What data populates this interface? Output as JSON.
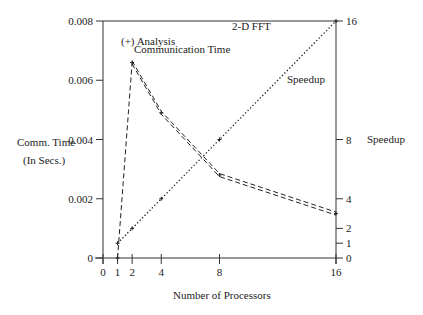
{
  "chart_data": {
    "type": "line",
    "title": "2-D FFT",
    "xlabel": "Number of Processors",
    "ylabel_left": [
      "Comm. Time",
      "(In Secs.)"
    ],
    "ylabel_right": "Speedup",
    "x_ticks": [
      0,
      1,
      2,
      4,
      8,
      16
    ],
    "xlim": [
      0,
      16
    ],
    "y_left_ticks": [
      "0",
      "0.002",
      "0.004",
      "0.006",
      "0.008"
    ],
    "y_left_tick_values": [
      0,
      0.002,
      0.004,
      0.006,
      0.008
    ],
    "ylim_left": [
      0,
      0.008
    ],
    "y_right_ticks": [
      "0",
      "1",
      "2",
      "4",
      "8",
      "16"
    ],
    "y_right_tick_values": [
      0,
      1,
      2,
      4,
      8,
      16
    ],
    "ylim_right": [
      0,
      16
    ],
    "grid": false,
    "x": [
      1,
      2,
      4,
      8,
      16
    ],
    "series": [
      {
        "name": "Communication Time",
        "axis": "left",
        "style": "double-dashed",
        "label_line1": "(+) Analysis",
        "label_line2": "Communication Time",
        "values": [
          0.0,
          0.0066,
          0.0049,
          0.0028,
          0.0015
        ]
      },
      {
        "name": "Speedup",
        "axis": "right",
        "style": "dotted",
        "label": "Speedup",
        "values": [
          1,
          2,
          4,
          8,
          16
        ]
      }
    ]
  },
  "colors": {
    "axis": "#333333",
    "line": "#222222",
    "background": "#ffffff"
  }
}
